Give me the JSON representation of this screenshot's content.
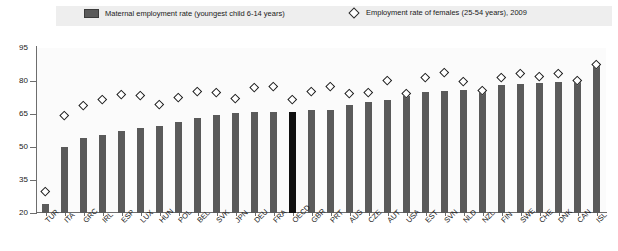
{
  "legend": {
    "bar_label": "Maternal employment rate (youngest child 6-14 years)",
    "marker_label": "Employment rate of females (25-54 years), 2009",
    "bar_color": "#5a5a5a",
    "marker_color": "#ffffff",
    "highlight_color": "#101010"
  },
  "chart_data": {
    "type": "bar",
    "title": "",
    "subtitle": "",
    "xlabel": "",
    "ylabel": "",
    "ylim": [
      20,
      95
    ],
    "yticks": [
      95,
      80,
      65,
      50,
      35,
      20
    ],
    "grid": false,
    "legend_position": "top",
    "highlight_category": "OECD",
    "categories": [
      "TUR",
      "ITA",
      "GRC",
      "IRL",
      "ESP",
      "LUX",
      "HUN",
      "POL",
      "BEL",
      "SVK",
      "JPN",
      "DEU",
      "FRA",
      "OECD",
      "GBR",
      "PRT",
      "AUS",
      "CZE",
      "AUT",
      "USA",
      "EST",
      "SVN",
      "NLD",
      "NZL",
      "FIN",
      "SWE",
      "CHE",
      "DNK",
      "CAN",
      "ISL"
    ],
    "series": [
      {
        "name": "Maternal employment rate (youngest child 6-14 years)",
        "type": "bar",
        "values": [
          24.0,
          49.8,
          54.0,
          55.5,
          57.5,
          58.5,
          59.5,
          61.5,
          63.0,
          64.5,
          65.5,
          66.0,
          66.0,
          66.0,
          67.0,
          67.0,
          69.0,
          70.5,
          71.5,
          73.0,
          75.0,
          75.5,
          76.0,
          76.5,
          78.0,
          78.5,
          79.0,
          79.5,
          80.5,
          88.0
        ]
      },
      {
        "name": "Employment rate of females (25-54 years), 2009",
        "type": "scatter",
        "values": [
          30.0,
          64.5,
          69.0,
          71.5,
          74.0,
          73.5,
          69.5,
          72.5,
          75.5,
          75.0,
          72.0,
          77.0,
          77.5,
          71.5,
          75.5,
          77.5,
          74.5,
          75.0,
          80.5,
          74.5,
          81.5,
          84.0,
          80.0,
          76.0,
          81.5,
          83.5,
          82.0,
          83.5,
          80.5,
          87.5
        ]
      }
    ]
  }
}
